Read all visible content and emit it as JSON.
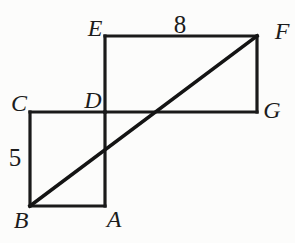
{
  "diagram": {
    "description_labels_only": "geometry figure",
    "vertex_labels": {
      "E": "E",
      "F": "F",
      "G": "G",
      "D": "D",
      "C": "C",
      "B": "B",
      "A": "A"
    },
    "side_labels": {
      "EF": "8",
      "CB": "5"
    }
  },
  "colors": {
    "line": "#1a1a1a",
    "text": "#1c1c1c",
    "background": "#fcfcfb"
  }
}
